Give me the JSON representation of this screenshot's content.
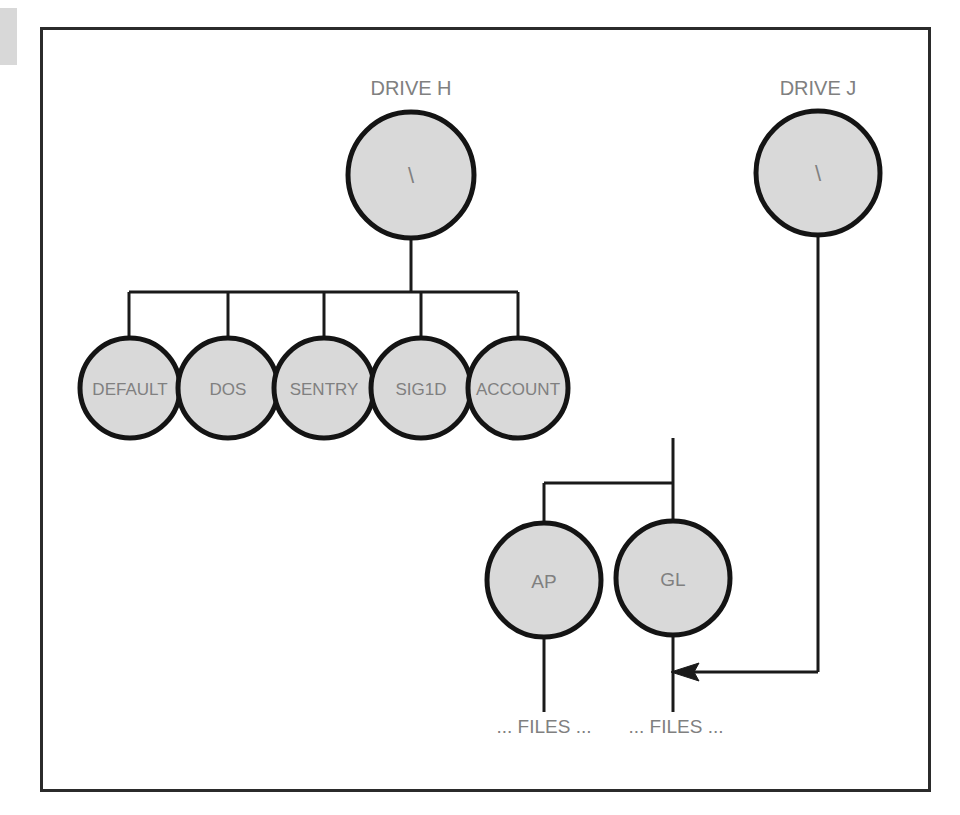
{
  "figure": {
    "kind": "directory-tree-diagram",
    "frame": {
      "visible": true,
      "border_color": "#2b2b2b"
    },
    "background_color": "#ffffff",
    "node_fill_color": "#d9d9d9",
    "node_stroke_color": "#141414",
    "label_color": "#808080",
    "line_color": "#1a1a1a"
  },
  "drives": [
    {
      "id": "drive-h",
      "caption": "DRIVE H",
      "root_label": "\\"
    },
    {
      "id": "drive-j",
      "caption": "DRIVE J",
      "root_label": "\\"
    }
  ],
  "nodes": {
    "root_h": {
      "label": "\\",
      "cx": 411,
      "cy": 175,
      "r": 63
    },
    "root_j": {
      "label": "\\",
      "cx": 818,
      "cy": 173,
      "r": 62
    },
    "level1": [
      {
        "label": "DEFAULT",
        "cx": 130,
        "cy": 388,
        "r": 50
      },
      {
        "label": "DOS",
        "cx": 228,
        "cy": 388,
        "r": 50
      },
      {
        "label": "SENTRY",
        "cx": 324,
        "cy": 388,
        "r": 50
      },
      {
        "label": "SIG1D",
        "cx": 421,
        "cy": 388,
        "r": 50
      },
      {
        "label": "ACCOUNT",
        "cx": 518,
        "cy": 388,
        "r": 50
      }
    ],
    "level2": [
      {
        "label": "AP",
        "cx": 544,
        "cy": 580,
        "r": 57
      },
      {
        "label": "GL",
        "cx": 673,
        "cy": 578,
        "r": 57
      }
    ]
  },
  "leaf_labels": [
    {
      "text": "... FILES ...",
      "x": 544,
      "y": 727
    },
    {
      "text": "... FILES ...",
      "x": 676,
      "y": 727
    }
  ],
  "connections": [
    {
      "from": "root_h",
      "to": "level1-bus",
      "type": "vertical-stem"
    },
    {
      "from": "level1-bus",
      "to": "DEFAULT",
      "type": "drop"
    },
    {
      "from": "level1-bus",
      "to": "DOS",
      "type": "drop"
    },
    {
      "from": "level1-bus",
      "to": "SENTRY",
      "type": "drop"
    },
    {
      "from": "level1-bus",
      "to": "SIG1D",
      "type": "drop"
    },
    {
      "from": "level1-bus",
      "to": "ACCOUNT",
      "type": "drop"
    },
    {
      "from": "ACCOUNT",
      "to": "level2-bus",
      "type": "vertical-stem"
    },
    {
      "from": "level2-bus",
      "to": "AP",
      "type": "drop"
    },
    {
      "from": "level2-bus",
      "to": "GL",
      "type": "drop"
    },
    {
      "from": "AP",
      "to": "files-left",
      "type": "vertical-stem"
    },
    {
      "from": "GL",
      "to": "files-right",
      "type": "vertical-stem"
    },
    {
      "from": "root_j",
      "to": "GL-stem",
      "type": "arrow",
      "arrowhead": "left"
    }
  ],
  "artifacts": [
    {
      "name": "scan-edge-smudge",
      "x": 0,
      "y": 8,
      "width": 17,
      "height": 57,
      "color": "#d8d8d8"
    }
  ]
}
